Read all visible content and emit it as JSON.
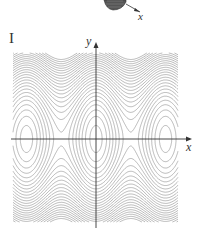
{
  "figure": {
    "panel_label": "I",
    "x_axis_label": "x",
    "y_axis_label": "y",
    "top_fragment_axis_label": "x",
    "colors": {
      "contour": "#9a9a9a",
      "axis": "#333333",
      "surface": "#555555"
    }
  },
  "chart_data": {
    "type": "contour",
    "title": "",
    "panel": "I",
    "xlabel": "x",
    "ylabel": "y",
    "function_shape": "z = y^2 - cos(x)",
    "x_range": [
      -7.5,
      7.5
    ],
    "y_range": [
      -3.2,
      3.2
    ],
    "grid": false,
    "tick_labels": []
  }
}
